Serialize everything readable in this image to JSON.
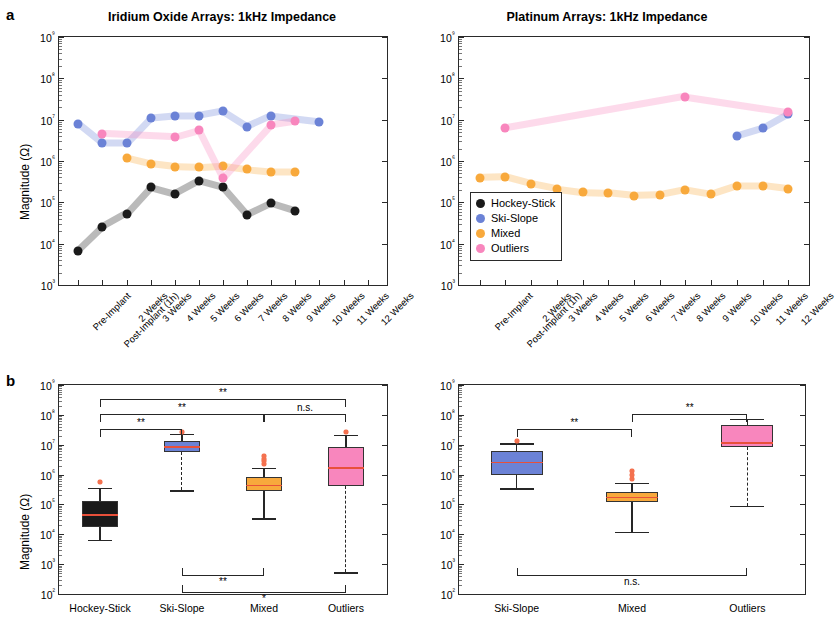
{
  "figure": {
    "panel_a_letter": "a",
    "panel_b_letter": "b",
    "ylabel": "Magnitude (Ω)"
  },
  "legend": {
    "items": [
      {
        "label": "Hockey-Stick",
        "color": "#1a1a1a"
      },
      {
        "label": "Ski-Slope",
        "color": "#6b82d6"
      },
      {
        "label": "Mixed",
        "color": "#f8a93c"
      },
      {
        "label": "Outliers",
        "color": "#f886bd"
      }
    ]
  },
  "colors": {
    "hockey_stick": "#1a1a1a",
    "ski_slope": "#6b82d6",
    "mixed": "#f8a93c",
    "outliers": "#f886bd",
    "median": "#e8503a",
    "axis": "#2a2a2a"
  },
  "chart_data": [
    {
      "id": "iro-timeseries",
      "type": "scatter",
      "title": "Iridium Oxide Arrays: 1kHz Impedance",
      "xlabel": "",
      "ylabel": "Magnitude (Ω)",
      "ylim": [
        1000,
        1000000000
      ],
      "ytick_labels": [
        "10³",
        "10⁴",
        "10⁵",
        "10⁶",
        "10⁷",
        "10⁸",
        "10⁹"
      ],
      "ytick_values": [
        1000,
        10000,
        100000,
        1000000,
        10000000,
        100000000,
        1000000000
      ],
      "log_scale": true,
      "grid": false,
      "legend_position": "none",
      "categories": [
        "Pre-Implant",
        "Post-Implant (1h)",
        "2 Weeks",
        "3 Weeks",
        "4 Weeks",
        "5 Weeks",
        "6 Weeks",
        "7 Weeks",
        "8 Weeks",
        "9 Weeks",
        "10 Weeks",
        "11 Weeks",
        "12 Weeks"
      ],
      "series": [
        {
          "name": "Hockey-Stick",
          "color": "#1a1a1a",
          "x": [
            0,
            1,
            2,
            3,
            4,
            5,
            6,
            7,
            8,
            9
          ],
          "values": [
            6800,
            25000.0,
            53000.0,
            230000.0,
            160000.0,
            330000.0,
            230000.0,
            50000.0,
            95000.0,
            62000.0
          ]
        },
        {
          "name": "Ski-Slope",
          "color": "#6b82d6",
          "x": [
            0,
            1,
            2,
            3,
            4,
            5,
            6,
            7,
            8,
            10
          ],
          "values": [
            8000000.0,
            2700000.0,
            2700000.0,
            11000000.0,
            12500000.0,
            12500000.0,
            16000000.0,
            6800000.0,
            12500000.0,
            9000000.0
          ]
        },
        {
          "name": "Mixed",
          "color": "#f8a93c",
          "x": [
            2,
            3,
            4,
            5,
            6,
            7,
            8,
            9
          ],
          "values": [
            1200000.0,
            860000.0,
            730000.0,
            700000.0,
            760000.0,
            630000.0,
            550000.0,
            550000.0
          ]
        },
        {
          "name": "Outliers",
          "color": "#f886bd",
          "x": [
            1,
            4,
            5,
            6,
            8,
            9
          ],
          "values": [
            4600000.0,
            3800000.0,
            5600000.0,
            380000.0,
            7400000.0,
            9200000.0
          ]
        }
      ]
    },
    {
      "id": "pt-timeseries",
      "type": "scatter",
      "title": "Platinum Arrays: 1kHz Impedance",
      "xlabel": "",
      "ylabel": "",
      "ylim": [
        1000,
        1000000000
      ],
      "ytick_labels": [
        "10³",
        "10⁴",
        "10⁵",
        "10⁶",
        "10⁷",
        "10⁸",
        "10⁹"
      ],
      "ytick_values": [
        1000,
        10000,
        100000,
        1000000,
        10000000,
        100000000,
        1000000000
      ],
      "log_scale": true,
      "grid": false,
      "legend_position": "lower-left",
      "categories": [
        "Pre-Implant",
        "Post-Implant (1h)",
        "2 Weeks",
        "3 Weeks",
        "4 Weeks",
        "5 Weeks",
        "6 Weeks",
        "7 Weeks",
        "8 Weeks",
        "9 Weeks",
        "10 Weeks",
        "11 Weeks",
        "12 Weeks"
      ],
      "series": [
        {
          "name": "Ski-Slope",
          "color": "#6b82d6",
          "x": [
            10,
            11,
            12
          ],
          "values": [
            4000000.0,
            6200000.0,
            14000000.0
          ]
        },
        {
          "name": "Mixed",
          "color": "#f8a93c",
          "x": [
            0,
            1,
            2,
            3,
            4,
            5,
            6,
            7,
            8,
            9,
            10,
            11,
            12
          ],
          "values": [
            390000.0,
            410000.0,
            280000.0,
            210000.0,
            175000.0,
            170000.0,
            145000.0,
            150000.0,
            200000.0,
            155000.0,
            250000.0,
            250000.0,
            210000.0
          ]
        },
        {
          "name": "Outliers",
          "color": "#f886bd",
          "x": [
            1,
            8,
            12
          ],
          "values": [
            6200000.0,
            36000000.0,
            15000000.0
          ]
        }
      ]
    },
    {
      "id": "iro-boxplot",
      "type": "box",
      "title": "",
      "xlabel": "",
      "ylabel": "Magnitude (Ω)",
      "ylim": [
        100,
        1000000000
      ],
      "ytick_labels": [
        "10²",
        "10³",
        "10⁴",
        "10⁵",
        "10⁶",
        "10⁷",
        "10⁸",
        "10⁹"
      ],
      "log_scale": true,
      "categories": [
        "Hockey-Stick",
        "Ski-Slope",
        "Mixed",
        "Outliers"
      ],
      "boxes": [
        {
          "name": "Hockey-Stick",
          "color": "#1a1a1a",
          "whisker_low": 6500.0,
          "q1": 18000.0,
          "median": 46000.0,
          "q3": 130000.0,
          "whisker_high": 360000.0,
          "outliers": [
            550000.0
          ],
          "whisker_style": "solid"
        },
        {
          "name": "Ski-Slope",
          "color": "#6b82d6",
          "whisker_low": 300000.0,
          "q1": 5500000.0,
          "median": 9000000.0,
          "q3": 13500000.0,
          "whisker_high": 23000000.0,
          "outliers": [
            26000000.0
          ],
          "whisker_style": "dashed-low"
        },
        {
          "name": "Mixed",
          "color": "#f8a93c",
          "whisker_low": 34000.0,
          "q1": 290000.0,
          "median": 460000.0,
          "q3": 850000.0,
          "whisker_high": 1700000.0,
          "outliers": [
            2300000.0,
            2800000.0,
            3400000.0,
            4300000.0
          ],
          "whisker_style": "solid"
        },
        {
          "name": "Outliers",
          "color": "#f886bd",
          "whisker_low": 540.0,
          "q1": 430000.0,
          "median": 1800000.0,
          "q3": 8500000.0,
          "whisker_high": 21000000.0,
          "outliers": [
            26000000.0
          ],
          "whisker_style": "dashed-low"
        }
      ],
      "significance": [
        {
          "from": "Hockey-Stick",
          "to": "Ski-Slope",
          "label": "**",
          "position": "top",
          "level": 1
        },
        {
          "from": "Hockey-Stick",
          "to": "Mixed",
          "label": "**",
          "position": "top",
          "level": 2
        },
        {
          "from": "Hockey-Stick",
          "to": "Outliers",
          "label": "**",
          "position": "top",
          "level": 3
        },
        {
          "from": "Mixed",
          "to": "Outliers",
          "label": "n.s.",
          "position": "top",
          "level": 2
        },
        {
          "from": "Ski-Slope",
          "to": "Mixed",
          "label": "**",
          "position": "bottom",
          "level": 1
        },
        {
          "from": "Ski-Slope",
          "to": "Outliers",
          "label": "*",
          "position": "bottom",
          "level": 2
        }
      ]
    },
    {
      "id": "pt-boxplot",
      "type": "box",
      "title": "",
      "xlabel": "",
      "ylabel": "",
      "ylim": [
        100,
        1000000000
      ],
      "ytick_labels": [
        "10²",
        "10³",
        "10⁴",
        "10⁵",
        "10⁶",
        "10⁷",
        "10⁸",
        "10⁹"
      ],
      "log_scale": true,
      "categories": [
        "Ski-Slope",
        "Mixed",
        "Outliers"
      ],
      "boxes": [
        {
          "name": "Ski-Slope",
          "color": "#6b82d6",
          "whisker_low": 350000.0,
          "q1": 1000000.0,
          "median": 2700000.0,
          "q3": 6000000.0,
          "whisker_high": 11000000.0,
          "outliers": [
            13000000.0
          ],
          "whisker_style": "solid"
        },
        {
          "name": "Mixed",
          "color": "#f8a93c",
          "whisker_low": 12000.0,
          "q1": 120000.0,
          "median": 180000.0,
          "q3": 260000.0,
          "whisker_high": 520000.0,
          "outliers": [
            700000.0,
            950000.0,
            1300000.0
          ],
          "whisker_style": "solid"
        },
        {
          "name": "Outliers",
          "color": "#f886bd",
          "whisker_low": 90000.0,
          "q1": 8500000.0,
          "median": 12000000.0,
          "q3": 45000000.0,
          "whisker_high": 75000000.0,
          "outliers": [],
          "whisker_style": "dashed-low"
        }
      ],
      "significance": [
        {
          "from": "Ski-Slope",
          "to": "Mixed",
          "label": "**",
          "position": "top",
          "level": 1
        },
        {
          "from": "Mixed",
          "to": "Outliers",
          "label": "**",
          "position": "top",
          "level": 2
        },
        {
          "from": "Ski-Slope",
          "to": "Outliers",
          "label": "n.s.",
          "position": "bottom",
          "level": 1
        }
      ]
    }
  ]
}
